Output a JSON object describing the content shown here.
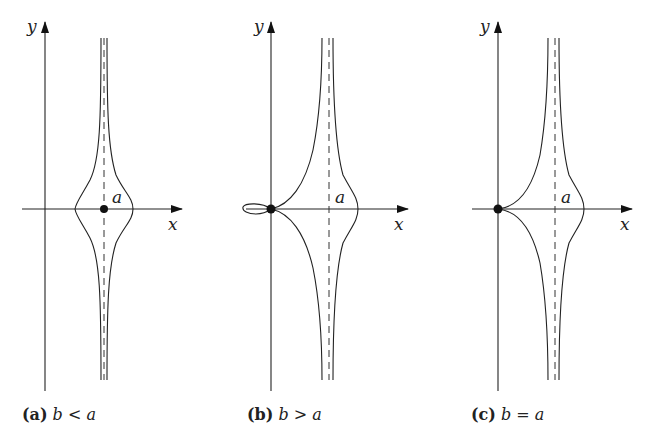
{
  "figure": {
    "panels": [
      {
        "id": "a",
        "tag": "(a)",
        "condition": "b < a",
        "axis_x_label": "x",
        "axis_y_label": "y",
        "point_label": "a",
        "marked_point": "(a, 0)"
      },
      {
        "id": "b",
        "tag": "(b)",
        "condition": "b > a",
        "axis_x_label": "x",
        "axis_y_label": "y",
        "point_label": "a",
        "marked_point": "origin (with loop)"
      },
      {
        "id": "c",
        "tag": "(c)",
        "condition": "b = a",
        "axis_x_label": "x",
        "axis_y_label": "y",
        "point_label": "a",
        "marked_point": "origin (cusp)"
      }
    ],
    "colors": {
      "ink": "#222222",
      "background": "#ffffff"
    }
  }
}
